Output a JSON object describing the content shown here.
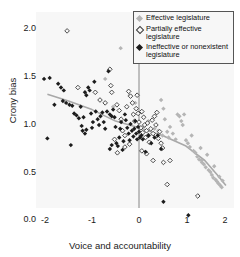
{
  "chart_data": {
    "type": "scatter",
    "title": "",
    "xlabel": "Voice and accountability",
    "ylabel": "Crony bias",
    "xlim": [
      -2.35,
      2.15
    ],
    "ylim": [
      -0.05,
      2.15
    ],
    "xticks": [
      "-2",
      "-1",
      "0",
      "1",
      "2"
    ],
    "xtick_values": [
      -2,
      -1,
      0,
      1,
      2
    ],
    "yticks": [
      "0.0",
      "0.5",
      "1.0",
      "1.5",
      "2.0"
    ],
    "ytick_values": [
      0.0,
      0.5,
      1.0,
      1.5,
      2.0
    ],
    "grid": false,
    "legend_position": "top-right",
    "reference_line_x": 0,
    "series": [
      {
        "name": "Effective legislature",
        "marker": "filled-diamond",
        "color": "#b5b5b5",
        "points": [
          [
            -0.72,
            1.47
          ],
          [
            -0.55,
            1.18
          ],
          [
            -0.39,
            1.79
          ],
          [
            -0.2,
            1.3
          ],
          [
            -0.08,
            1.22
          ],
          [
            0.05,
            1.12
          ],
          [
            0.1,
            0.97
          ],
          [
            0.2,
            1.03
          ],
          [
            0.33,
            0.95
          ],
          [
            0.41,
            0.93
          ],
          [
            0.47,
            1.25
          ],
          [
            0.52,
            1.16
          ],
          [
            0.55,
            1.05
          ],
          [
            0.6,
            0.92
          ],
          [
            0.63,
            0.86
          ],
          [
            0.66,
            0.97
          ],
          [
            0.72,
            0.9
          ],
          [
            0.78,
            0.84
          ],
          [
            0.82,
            1.1
          ],
          [
            0.86,
            1.08
          ],
          [
            0.9,
            1.03
          ],
          [
            0.93,
            0.99
          ],
          [
            0.96,
            1.1
          ],
          [
            1.0,
            0.83
          ],
          [
            1.04,
            0.8
          ],
          [
            1.08,
            0.76
          ],
          [
            1.12,
            0.88
          ],
          [
            1.16,
            0.72
          ],
          [
            1.2,
            0.7
          ],
          [
            1.24,
            0.66
          ],
          [
            1.28,
            0.63
          ],
          [
            1.31,
            0.75
          ],
          [
            1.34,
            0.6
          ],
          [
            1.38,
            0.58
          ],
          [
            1.42,
            0.55
          ],
          [
            1.45,
            0.68
          ],
          [
            1.48,
            0.52
          ],
          [
            1.52,
            0.5
          ],
          [
            1.55,
            0.47
          ],
          [
            1.58,
            0.44
          ],
          [
            1.6,
            0.56
          ],
          [
            1.63,
            0.42
          ],
          [
            1.66,
            0.4
          ],
          [
            1.69,
            0.38
          ],
          [
            1.71,
            0.45
          ],
          [
            1.73,
            0.36
          ],
          [
            1.76,
            0.34
          ],
          [
            1.78,
            0.41
          ],
          [
            1.33,
            0.62
          ],
          [
            0.5,
            0.88
          ]
        ]
      },
      {
        "name": "Partially effective legislature",
        "marker": "open-diamond",
        "color": "#3a3a3a",
        "points": [
          [
            -1.53,
            1.97
          ],
          [
            -1.3,
            1.38
          ],
          [
            -0.93,
            1.33
          ],
          [
            -0.83,
            1.25
          ],
          [
            -0.72,
            1.22
          ],
          [
            -0.62,
            1.57
          ],
          [
            -0.6,
            1.4
          ],
          [
            -0.58,
            1.33
          ],
          [
            -0.47,
            1.2
          ],
          [
            -0.42,
            1.14
          ],
          [
            -0.38,
            1.05
          ],
          [
            -0.35,
            0.93
          ],
          [
            -0.3,
            0.88
          ],
          [
            -0.26,
            1.18
          ],
          [
            -0.22,
            1.34
          ],
          [
            -0.18,
            1.29
          ],
          [
            -0.14,
            1.22
          ],
          [
            -0.12,
            1.1
          ],
          [
            -0.09,
            1.03
          ],
          [
            -0.06,
            1.16
          ],
          [
            -0.04,
            1.3
          ],
          [
            -0.02,
            1.11
          ],
          [
            0.0,
            1.02
          ],
          [
            0.02,
            1.9
          ],
          [
            0.04,
            0.96
          ],
          [
            0.06,
            1.13
          ],
          [
            0.08,
            0.91
          ],
          [
            0.1,
            1.07
          ],
          [
            0.12,
            0.99
          ],
          [
            0.14,
            0.86
          ],
          [
            0.16,
            0.93
          ],
          [
            0.18,
            1.01
          ],
          [
            0.2,
            0.88
          ],
          [
            0.22,
            0.81
          ],
          [
            0.25,
            0.95
          ],
          [
            0.28,
            1.04
          ],
          [
            0.3,
            0.9
          ],
          [
            0.33,
            1.08
          ],
          [
            0.36,
            0.99
          ],
          [
            0.38,
            1.12
          ],
          [
            0.41,
            0.85
          ],
          [
            0.44,
            0.92
          ],
          [
            0.47,
            0.8
          ],
          [
            0.5,
            0.75
          ],
          [
            0.16,
            0.69
          ],
          [
            0.3,
            0.62
          ],
          [
            0.52,
            0.6
          ],
          [
            0.6,
            0.37
          ],
          [
            0.66,
            0.62
          ],
          [
            1.25,
            0.25
          ],
          [
            -0.52,
            0.84
          ],
          [
            -0.3,
            0.76
          ],
          [
            -0.2,
            0.79
          ],
          [
            0.06,
            0.72
          ],
          [
            -0.46,
            0.7
          ]
        ]
      },
      {
        "name": "Ineffective or nonexistent legislature",
        "marker": "filled-diamond",
        "color": "#1c1c1c",
        "points": [
          [
            -2.02,
            1.47
          ],
          [
            -1.9,
            1.48
          ],
          [
            -1.95,
            0.85
          ],
          [
            -1.8,
            1.2
          ],
          [
            -1.72,
            1.42
          ],
          [
            -1.66,
            1.38
          ],
          [
            -1.6,
            1.35
          ],
          [
            -1.62,
            1.24
          ],
          [
            -1.55,
            1.22
          ],
          [
            -1.48,
            1.2
          ],
          [
            -1.42,
            1.19
          ],
          [
            -1.45,
            0.78
          ],
          [
            -1.38,
            1.11
          ],
          [
            -1.33,
            1.09
          ],
          [
            -1.28,
            1.06
          ],
          [
            -1.24,
            1.18
          ],
          [
            -1.22,
            0.98
          ],
          [
            -1.2,
            0.93
          ],
          [
            -1.18,
            1.07
          ],
          [
            -1.15,
            1.33
          ],
          [
            -1.12,
            1.3
          ],
          [
            -1.08,
            1.38
          ],
          [
            -1.05,
            1.35
          ],
          [
            -1.02,
            1.11
          ],
          [
            -1.0,
            0.96
          ],
          [
            -0.98,
            1.02
          ],
          [
            -0.95,
            1.44
          ],
          [
            -0.92,
            1.13
          ],
          [
            -0.88,
            1.05
          ],
          [
            -0.85,
            0.99
          ],
          [
            -0.82,
            1.08
          ],
          [
            -0.78,
            1.12
          ],
          [
            -0.75,
            1.02
          ],
          [
            -0.72,
            0.95
          ],
          [
            -0.68,
            1.13
          ],
          [
            -0.65,
            1.55
          ],
          [
            -0.62,
            1.1
          ],
          [
            -0.58,
            1.08
          ],
          [
            -0.55,
            1.15
          ],
          [
            -0.52,
            1.07
          ],
          [
            -0.5,
            0.97
          ],
          [
            -0.48,
            0.8
          ],
          [
            -0.45,
            0.77
          ],
          [
            -0.42,
            0.86
          ],
          [
            -0.4,
            0.95
          ],
          [
            -0.38,
            1.02
          ],
          [
            -0.35,
            0.73
          ],
          [
            -0.33,
            0.82
          ],
          [
            -0.3,
            1.1
          ],
          [
            -0.28,
            1.04
          ],
          [
            -0.25,
            0.96
          ],
          [
            -0.22,
            0.9
          ],
          [
            -0.2,
            0.83
          ],
          [
            -0.18,
            1.0
          ],
          [
            -0.15,
            0.93
          ],
          [
            -0.12,
            0.87
          ],
          [
            -0.1,
            0.95
          ],
          [
            -0.08,
            1.03
          ],
          [
            -0.06,
            0.9
          ],
          [
            -0.04,
            0.84
          ],
          [
            -0.02,
            0.97
          ],
          [
            0.0,
            0.92
          ],
          [
            0.02,
            0.86
          ],
          [
            0.05,
            0.88
          ],
          [
            0.08,
            0.84
          ],
          [
            0.14,
            0.71
          ],
          [
            0.2,
            0.88
          ],
          [
            0.26,
            0.8
          ],
          [
            0.33,
            0.86
          ],
          [
            0.4,
            0.88
          ],
          [
            0.47,
            0.74
          ],
          [
            0.52,
            0.19
          ],
          [
            1.05,
            0.05
          ],
          [
            -0.62,
            0.74
          ],
          [
            -0.58,
            0.78
          ],
          [
            -1.12,
            0.94
          ],
          [
            -1.15,
            0.9
          ]
        ]
      }
    ],
    "trend_line": {
      "color": "#a8a8a8",
      "points": [
        [
          -1.95,
          1.31
        ],
        [
          -1.5,
          1.24
        ],
        [
          -1.0,
          1.15
        ],
        [
          -0.5,
          1.03
        ],
        [
          0.0,
          0.96
        ],
        [
          0.5,
          0.88
        ],
        [
          1.0,
          0.77
        ],
        [
          1.4,
          0.62
        ],
        [
          1.7,
          0.45
        ],
        [
          1.85,
          0.36
        ]
      ]
    }
  },
  "legend": {
    "items": [
      {
        "label": "Effective legislature",
        "marker": "filled-diamond-gray"
      },
      {
        "label": "Partially effective legislature",
        "marker": "open-diamond"
      },
      {
        "label": "Ineffective or nonexistent legislature",
        "marker": "filled-diamond-black"
      }
    ]
  }
}
